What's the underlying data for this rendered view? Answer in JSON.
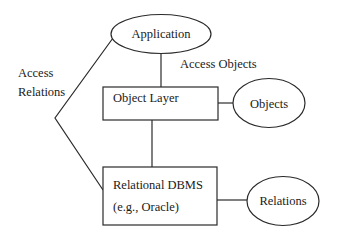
{
  "diagram": {
    "type": "architecture",
    "nodes": {
      "application": {
        "label": "Application",
        "shape": "ellipse"
      },
      "object_layer": {
        "label": "Object Layer",
        "shape": "rectangle"
      },
      "objects": {
        "label": "Objects",
        "shape": "ellipse"
      },
      "rdbms": {
        "label_line1": "Relational DBMS",
        "label_line2": "(e.g., Oracle)",
        "shape": "rectangle"
      },
      "relations": {
        "label": "Relations",
        "shape": "ellipse"
      }
    },
    "edges": {
      "access_objects": {
        "label": "Access Objects",
        "from": "Application",
        "to": "Object Layer"
      },
      "access_relations": {
        "label_line1": "Access",
        "label_line2": "Relations",
        "from": "Application",
        "to": "Relational DBMS"
      },
      "layer_to_objects": {
        "from": "Object Layer",
        "to": "Objects"
      },
      "layer_to_rdbms": {
        "from": "Object Layer",
        "to": "Relational DBMS"
      },
      "rdbms_to_relations": {
        "from": "Relational DBMS",
        "to": "Relations"
      }
    }
  },
  "colors": {
    "stroke": "#2a2a2a",
    "text": "#1a1a1a",
    "background": "#ffffff"
  }
}
